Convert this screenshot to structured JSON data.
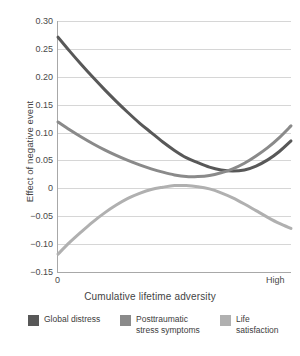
{
  "chart_data": {
    "type": "line",
    "title": "",
    "xlabel": "Cumulative lifetime adversity",
    "ylabel": "Effect of negative event",
    "xlim": [
      0,
      1
    ],
    "ylim": [
      -0.15,
      0.3
    ],
    "yticks": [
      0.3,
      0.25,
      0.2,
      0.15,
      0.1,
      0.05,
      0,
      -0.05,
      -0.1,
      -0.15
    ],
    "ytick_labels": [
      "0.30",
      "0.25",
      "0.20",
      "0.15",
      "0.10",
      "0.05",
      "0",
      "−0.05",
      "−0.10",
      "−0.15"
    ],
    "xtick_labels": [
      "0",
      "High"
    ],
    "grid": "horizontal",
    "legend_position": "bottom",
    "series": [
      {
        "name": "Global distress",
        "color": "#585858",
        "x": [
          0.0,
          0.05,
          0.1,
          0.15,
          0.2,
          0.25,
          0.3,
          0.35,
          0.4,
          0.45,
          0.5,
          0.55,
          0.6,
          0.65,
          0.7,
          0.75,
          0.8,
          0.85,
          0.9,
          0.95,
          1.0
        ],
        "values": [
          0.271,
          0.246,
          0.222,
          0.199,
          0.177,
          0.156,
          0.136,
          0.117,
          0.1,
          0.083,
          0.068,
          0.055,
          0.046,
          0.038,
          0.033,
          0.031,
          0.033,
          0.04,
          0.051,
          0.066,
          0.085
        ]
      },
      {
        "name": "Posttraumatic\nstress symptoms",
        "color": "#8a8a8a",
        "x": [
          0.0,
          0.05,
          0.1,
          0.15,
          0.2,
          0.25,
          0.3,
          0.35,
          0.4,
          0.45,
          0.5,
          0.55,
          0.6,
          0.65,
          0.7,
          0.75,
          0.8,
          0.85,
          0.9,
          0.95,
          1.0
        ],
        "values": [
          0.119,
          0.105,
          0.092,
          0.08,
          0.069,
          0.059,
          0.05,
          0.042,
          0.035,
          0.029,
          0.024,
          0.021,
          0.021,
          0.023,
          0.028,
          0.035,
          0.045,
          0.058,
          0.073,
          0.091,
          0.112
        ]
      },
      {
        "name": "Life satisfaction",
        "color": "#b0b0b0",
        "x": [
          0.0,
          0.05,
          0.1,
          0.15,
          0.2,
          0.25,
          0.3,
          0.35,
          0.4,
          0.45,
          0.5,
          0.55,
          0.6,
          0.65,
          0.7,
          0.75,
          0.8,
          0.85,
          0.9,
          0.95,
          1.0
        ],
        "values": [
          -0.118,
          -0.097,
          -0.078,
          -0.06,
          -0.044,
          -0.03,
          -0.018,
          -0.009,
          -0.002,
          0.002,
          0.005,
          0.005,
          0.003,
          -0.001,
          -0.008,
          -0.017,
          -0.028,
          -0.04,
          -0.052,
          -0.063,
          -0.072
        ]
      }
    ]
  },
  "axis": {
    "y_title": "Effect of negative event",
    "x_title": "Cumulative lifetime adversity",
    "x_start": "0",
    "x_end": "High",
    "y_labels": [
      "0.30",
      "0.25",
      "0.20",
      "0.15",
      "0.10",
      "0.05",
      "0",
      "−0.05",
      "−0.10",
      "−0.15"
    ]
  },
  "legend": {
    "items": [
      {
        "label": "Global distress",
        "color": "#585858"
      },
      {
        "label": "Posttraumatic\nstress symptoms",
        "color": "#8a8a8a"
      },
      {
        "label": "Life satisfaction",
        "color": "#b0b0b0"
      }
    ]
  }
}
